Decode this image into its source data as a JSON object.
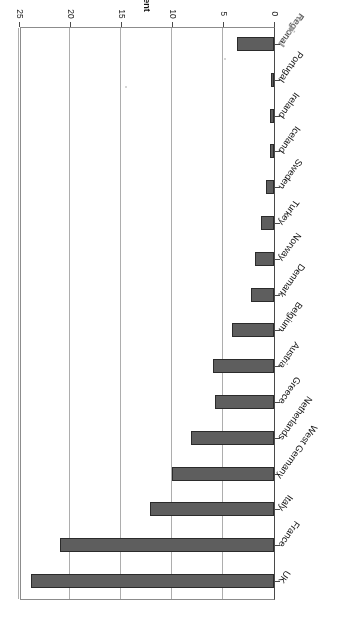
{
  "chart_data": {
    "type": "bar",
    "orientation": "horizontal",
    "title": "",
    "subtitle": "",
    "xlabel": "Per cent",
    "ylabel": "",
    "xlim": [
      0,
      25
    ],
    "xticks": [
      "0",
      "5",
      "10",
      "15",
      "20",
      "25"
    ],
    "xtick_values": [
      0,
      5,
      10,
      15,
      20,
      25
    ],
    "grid": true,
    "legend": false,
    "legend_position": "none",
    "categories": [
      "UK",
      "France",
      "Italy",
      "West Germany",
      "Netherlands",
      "Greece",
      "Austria",
      "Belgium",
      "Denmark",
      "Norway",
      "Turkey",
      "Sweden",
      "Iceland",
      "Ireland",
      "Portugal",
      "Regional"
    ],
    "values": [
      23.8,
      21.0,
      12.2,
      10.0,
      8.1,
      5.8,
      6.0,
      4.1,
      2.3,
      1.9,
      1.3,
      0.8,
      0.4,
      0.4,
      0.3,
      3.6
    ],
    "bar_color": "#5e5e5e",
    "bar_edge_color": "#2b2b2b",
    "grid_color": "#adadad",
    "axis_color": "#4a4a4a",
    "background": "#ffffff",
    "page_rotation_deg": 180
  },
  "figure": {
    "axis_title": "Per cent"
  }
}
